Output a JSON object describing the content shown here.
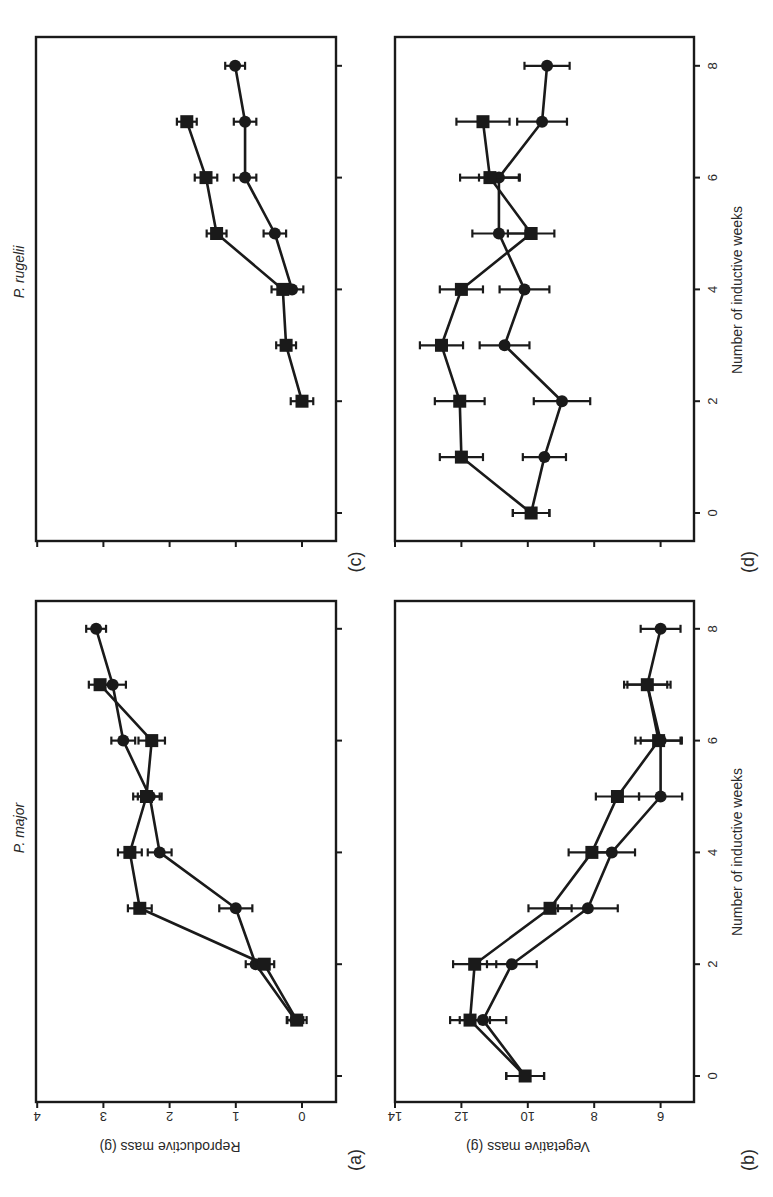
{
  "figure": {
    "orientation": "rotated 90 degrees counter-clockwise",
    "panel_labels": [
      "(a)",
      "(b)",
      "(c)",
      "(d)"
    ],
    "titles": {
      "left_column": "P. major",
      "right_column": "P. rugelii"
    },
    "xlabel": "Number of inductive weeks",
    "ylabel_reproductive": "Reproductive mass (g)",
    "ylabel_vegetative": "Vegetative mass (g)",
    "x_ticks": [
      0,
      2,
      4,
      6,
      8
    ],
    "reproductive_ticks": [
      4,
      3,
      2,
      1,
      0
    ],
    "vegetative_ticks": [
      14,
      12,
      10,
      8,
      6
    ]
  },
  "chart_data": [
    {
      "panel": "(a)",
      "type": "line",
      "title": "P. major",
      "xlabel": "Number of inductive weeks",
      "ylabel": "Reproductive mass (g)",
      "xlim": [
        -0.5,
        8.5
      ],
      "ylim": [
        -0.5,
        4
      ],
      "xticks": [
        0,
        2,
        4,
        6,
        8
      ],
      "yticks": [
        0,
        1,
        2,
        3,
        4
      ],
      "series": [
        {
          "name": "circles",
          "marker": "circle",
          "x": [
            1,
            2,
            3,
            4,
            5,
            6,
            7,
            8
          ],
          "values": [
            0.1,
            0.7,
            1.0,
            2.15,
            2.3,
            2.7,
            2.86,
            3.11
          ],
          "errors": [
            0.12,
            0.15,
            0.25,
            0.18,
            0.18,
            0.18,
            0.2,
            0.15
          ]
        },
        {
          "name": "squares",
          "marker": "square",
          "x": [
            1,
            2,
            3,
            4,
            5,
            6,
            7
          ],
          "values": [
            0.08,
            0.57,
            2.45,
            2.6,
            2.35,
            2.27,
            3.05
          ],
          "errors": [
            0.15,
            0.15,
            0.18,
            0.18,
            0.2,
            0.2,
            0.17
          ]
        }
      ]
    },
    {
      "panel": "(b)",
      "type": "line",
      "title": "P. major",
      "xlabel": "Number of inductive weeks",
      "ylabel": "Vegetative mass (g)",
      "xlim": [
        -0.5,
        8.5
      ],
      "ylim": [
        5,
        14
      ],
      "xticks": [
        0,
        2,
        4,
        6,
        8
      ],
      "yticks": [
        6,
        8,
        10,
        12,
        14
      ],
      "series": [
        {
          "name": "circles",
          "marker": "circle",
          "x": [
            0,
            1,
            2,
            3,
            4,
            5,
            6,
            7,
            8
          ],
          "values": [
            10.08,
            11.35,
            10.48,
            8.19,
            7.47,
            6.0,
            6.0,
            6.4,
            6.0
          ],
          "errors": [
            0.57,
            0.7,
            0.75,
            0.9,
            0.7,
            0.65,
            0.6,
            0.6,
            0.6
          ]
        },
        {
          "name": "squares",
          "marker": "square",
          "x": [
            0,
            1,
            2,
            3,
            4,
            5,
            6,
            7
          ],
          "values": [
            10.08,
            11.74,
            11.6,
            9.33,
            8.07,
            7.3,
            6.06,
            6.4
          ],
          "errors": [
            0.57,
            0.6,
            0.65,
            0.65,
            0.7,
            0.65,
            0.7,
            0.7
          ]
        }
      ]
    },
    {
      "panel": "(c)",
      "type": "line",
      "title": "P. rugelii",
      "xlabel": "",
      "ylabel": "",
      "xlim": [
        -0.5,
        8.5
      ],
      "ylim": [
        -0.5,
        4
      ],
      "xticks": [
        0,
        2,
        4,
        6,
        8
      ],
      "yticks": [
        0,
        1,
        2,
        3,
        4
      ],
      "series": [
        {
          "name": "circles",
          "marker": "circle",
          "x": [
            4,
            5,
            6,
            7,
            8
          ],
          "values": [
            0.15,
            0.41,
            0.86,
            0.86,
            1.01
          ],
          "errors": [
            0.17,
            0.17,
            0.17,
            0.17,
            0.15
          ]
        },
        {
          "name": "squares",
          "marker": "square",
          "x": [
            2,
            3,
            4,
            5,
            6,
            7
          ],
          "values": [
            0.0,
            0.24,
            0.29,
            1.29,
            1.45,
            1.74
          ],
          "errors": [
            0.17,
            0.15,
            0.17,
            0.15,
            0.17,
            0.15
          ]
        }
      ]
    },
    {
      "panel": "(d)",
      "type": "line",
      "title": "P. rugelii",
      "xlabel": "Number of inductive weeks",
      "ylabel": "",
      "xlim": [
        -0.5,
        8.5
      ],
      "ylim": [
        5,
        14
      ],
      "xticks": [
        0,
        2,
        4,
        6,
        8
      ],
      "yticks": [
        6,
        8,
        10,
        12,
        14
      ],
      "series": [
        {
          "name": "circles",
          "marker": "circle",
          "x": [
            0,
            1,
            2,
            3,
            4,
            5,
            6,
            7,
            8
          ],
          "values": [
            9.9,
            9.5,
            8.97,
            10.7,
            10.1,
            10.87,
            10.87,
            9.57,
            9.42
          ],
          "errors": [
            0.55,
            0.65,
            0.85,
            0.75,
            0.75,
            0.8,
            0.6,
            0.75,
            0.68
          ]
        },
        {
          "name": "squares",
          "marker": "square",
          "x": [
            0,
            1,
            2,
            3,
            4,
            5,
            6,
            7
          ],
          "values": [
            9.9,
            12.0,
            12.05,
            12.6,
            12.0,
            9.9,
            11.14,
            11.35
          ],
          "errors": [
            0.55,
            0.65,
            0.75,
            0.65,
            0.65,
            0.7,
            0.9,
            0.8
          ]
        }
      ]
    }
  ]
}
